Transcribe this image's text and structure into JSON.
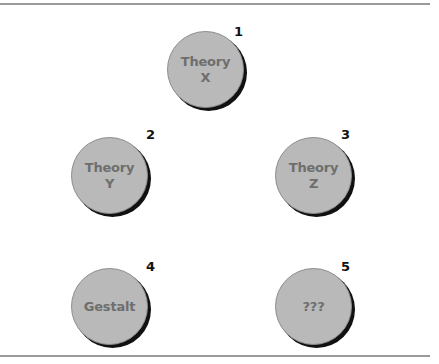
{
  "diagram": {
    "nodes": [
      {
        "number": "1",
        "line1": "Theory",
        "line2": "X"
      },
      {
        "number": "2",
        "line1": "Theory",
        "line2": "Y"
      },
      {
        "number": "3",
        "line1": "Theory",
        "line2": "Z"
      },
      {
        "number": "4",
        "line1": "Gestalt",
        "line2": ""
      },
      {
        "number": "5",
        "line1": "???",
        "line2": ""
      }
    ],
    "colors": {
      "disc_fill": "#b9b9b9",
      "disc_text": "#6e6e6e",
      "shadow": "#111111",
      "rule": "#9a9a9a"
    }
  }
}
